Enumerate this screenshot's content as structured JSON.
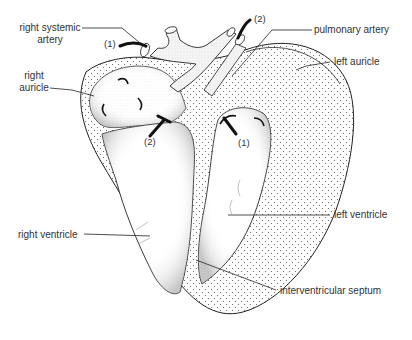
{
  "diagram": {
    "labels": {
      "right_systemic_artery_l1": "right systemic",
      "right_systemic_artery_l2": "artery",
      "right_auricle_l1": "right",
      "right_auricle_l2": "auricle",
      "pulmonary_artery": "pulmonary artery",
      "left_auricle": "left auricle",
      "left_ventricle": "left ventricle",
      "right_ventricle": "right ventricle",
      "interventricular_septum": "interventricular septum"
    },
    "markers": {
      "probe_systemic": "(1)",
      "probe_pulmonary": "(2)",
      "probe_right_av": "(2)",
      "probe_left_av": "(1)"
    },
    "colors": {
      "line": "#222222",
      "stipple": "#555555",
      "text": "#333333",
      "background": "#ffffff"
    }
  }
}
